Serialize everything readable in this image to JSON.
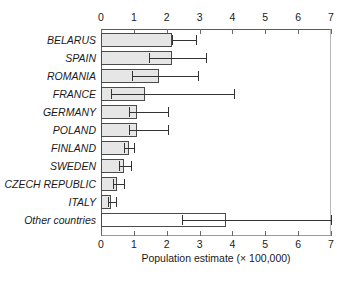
{
  "chart_data": {
    "type": "bar",
    "orientation": "horizontal",
    "title": "",
    "xlabel": "Population estimate (× 100,000)",
    "ylabel": "",
    "xlim": [
      0,
      7
    ],
    "xticks": [
      0,
      1,
      2,
      3,
      4,
      5,
      6,
      7
    ],
    "xtick_labels": [
      "0",
      "1",
      "2",
      "3",
      "4",
      "5",
      "6",
      "7"
    ],
    "axis_top": true,
    "axis_bottom": true,
    "grid": false,
    "legend": null,
    "categories": [
      "BELARUS",
      "SPAIN",
      "ROMANIA",
      "FRANCE",
      "GERMANY",
      "POLAND",
      "FINLAND",
      "SWEDEN",
      "CZECH REPUBLIC",
      "ITALY",
      "Other countries"
    ],
    "values": [
      2.15,
      2.15,
      1.75,
      1.35,
      1.1,
      1.1,
      0.85,
      0.7,
      0.5,
      0.3,
      3.8
    ],
    "error_low": [
      2.15,
      1.45,
      0.95,
      0.3,
      0.85,
      0.85,
      0.7,
      0.55,
      0.35,
      0.2,
      2.45
    ],
    "error_high": [
      2.9,
      3.2,
      2.95,
      4.05,
      2.05,
      2.05,
      1.0,
      0.9,
      0.7,
      0.45,
      7.0
    ],
    "bar_fill": "#e6e6e6",
    "bar_fill_other": "#ffffff",
    "bar_edge": "#4a4a4a",
    "error_color": "#333333"
  }
}
